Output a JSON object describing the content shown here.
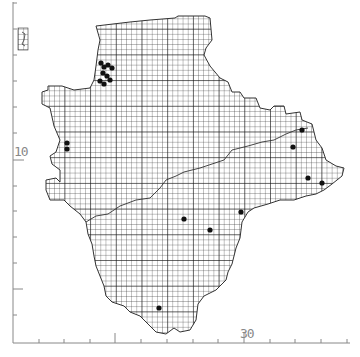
{
  "map": {
    "type": "grid-square distribution map",
    "axes": {
      "y_label_major": "10",
      "x_label_major": "30",
      "tick_spacing_px": 25.7
    },
    "colors": {
      "background": "#ffffff",
      "grid": "#222222",
      "coast": "#333333",
      "axis": "#888888",
      "record_dot": "#111111"
    },
    "records": [
      {
        "x": 101,
        "y": 63
      },
      {
        "x": 104,
        "y": 67
      },
      {
        "x": 108,
        "y": 65
      },
      {
        "x": 112,
        "y": 68
      },
      {
        "x": 103,
        "y": 73
      },
      {
        "x": 107,
        "y": 76
      },
      {
        "x": 100,
        "y": 81
      },
      {
        "x": 104,
        "y": 84
      },
      {
        "x": 110,
        "y": 80
      },
      {
        "x": 67,
        "y": 143
      },
      {
        "x": 67,
        "y": 149
      },
      {
        "x": 184,
        "y": 219
      },
      {
        "x": 210,
        "y": 230
      },
      {
        "x": 241,
        "y": 212
      },
      {
        "x": 302,
        "y": 130
      },
      {
        "x": 293,
        "y": 147
      },
      {
        "x": 308,
        "y": 178
      },
      {
        "x": 322,
        "y": 183
      },
      {
        "x": 159,
        "y": 308
      }
    ]
  }
}
